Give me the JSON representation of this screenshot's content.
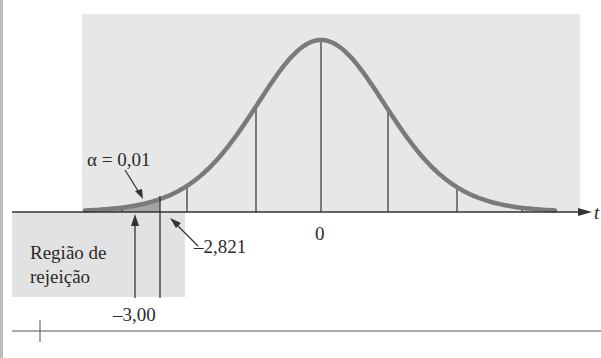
{
  "chart_data": {
    "type": "area",
    "title": "",
    "distribution": "t (Student)",
    "xlabel": "t",
    "ylabel": "",
    "center_label": "0",
    "critical_value": -2.821,
    "critical_value_label": "–2,821",
    "test_statistic": -3.0,
    "test_statistic_label": "–3,00",
    "alpha": 0.01,
    "alpha_label": "α = 0,01",
    "rejection_region_label": [
      "Região de",
      "rejeição"
    ],
    "shaded_region": {
      "from": "-inf",
      "to": -2.821
    },
    "vertical_gridlines_x_px": [
      122,
      187,
      256,
      321,
      388,
      457,
      522
    ],
    "grid": false,
    "legend": "none",
    "colors": {
      "curve": "#7a7a7a",
      "panel": "#e6e6e6",
      "rejection_box": "#e0e0e0",
      "tail_fill": "#9a9a9a",
      "axis": "#333333"
    }
  },
  "labels": {
    "alpha": "α = 0,01",
    "critical": "–2,821",
    "stat": "–3,00",
    "zero": "0",
    "t_axis": "t",
    "region_line1": "Região de",
    "region_line2": "rejeição"
  }
}
